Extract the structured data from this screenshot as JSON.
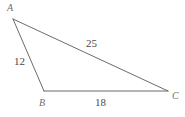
{
  "figure": {
    "type": "triangle-diagram",
    "background_color": "#ffffff",
    "stroke_color": "#5a5a5a",
    "label_color": "#6e6e6e",
    "measure_color": "#4a4a4a",
    "vertices": [
      {
        "name": "A",
        "label": "A",
        "x": 13,
        "y": 19
      },
      {
        "name": "B",
        "label": "B",
        "x": 44,
        "y": 91
      },
      {
        "name": "C",
        "label": "C",
        "x": 168,
        "y": 91
      }
    ],
    "sides": [
      {
        "name": "AB",
        "label": "12",
        "from": "A",
        "to": "B"
      },
      {
        "name": "AC",
        "label": "25",
        "from": "A",
        "to": "C"
      },
      {
        "name": "BC",
        "label": "18",
        "from": "B",
        "to": "C"
      }
    ]
  }
}
